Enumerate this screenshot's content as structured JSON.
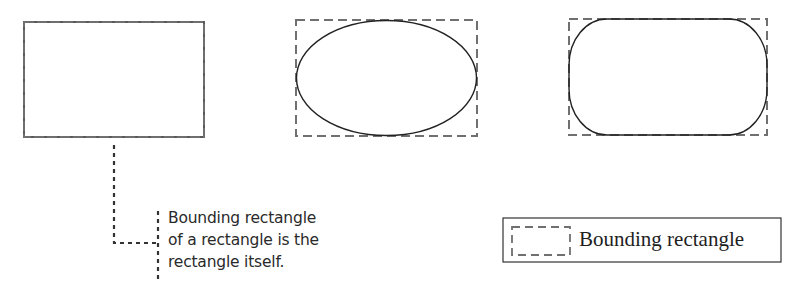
{
  "figure": {
    "shapes": [
      {
        "id": "rectangle",
        "label": "Rectangle whose bounding rectangle is itself"
      },
      {
        "id": "ellipse",
        "label": "Ellipse with dashed bounding rectangle"
      },
      {
        "id": "rounded-rectangle",
        "label": "Rounded rectangle with dashed bounding rectangle"
      }
    ],
    "callout": {
      "lines": [
        "Bounding rectangle",
        "of a rectangle is the",
        "rectangle itself."
      ]
    },
    "legend": {
      "label": "Bounding rectangle"
    },
    "colors": {
      "shape_stroke": "#222222",
      "dashed_stroke": "#6e6e6e",
      "leader_stroke": "#333333",
      "legend_border": "#333333"
    }
  }
}
